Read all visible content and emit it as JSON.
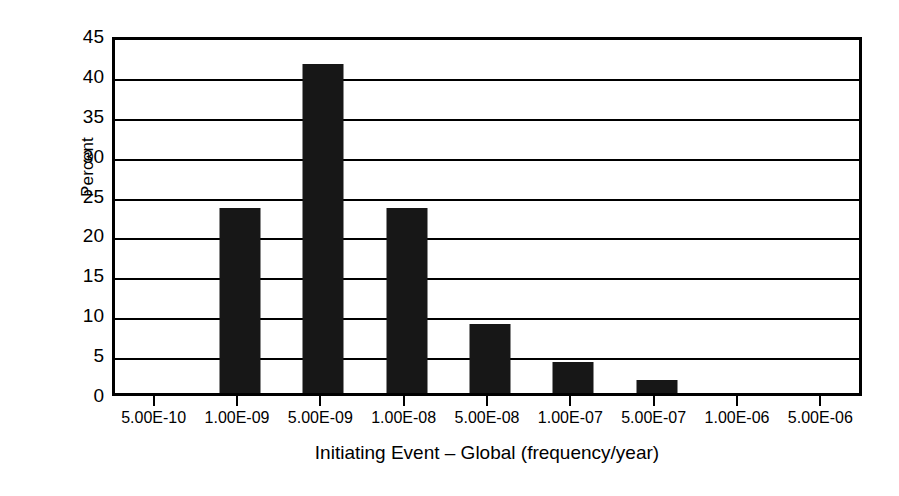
{
  "chart_data": {
    "type": "bar",
    "title": "",
    "xlabel": "Initiating Event – Global (frequency/year)",
    "ylabel": "Percent",
    "categories": [
      "5.00E-10",
      "1.00E-09",
      "5.00E-09",
      "1.00E-08",
      "5.00E-08",
      "1.00E-07",
      "5.00E-07",
      "1.00E-06",
      "5.00E-06"
    ],
    "values": [
      0,
      23.2,
      41.2,
      23.2,
      8.7,
      3.9,
      1.6,
      0,
      0
    ],
    "ylim": [
      0,
      45
    ],
    "ytick_labels": [
      "45",
      "40",
      "35",
      "30",
      "25",
      "20",
      "15",
      "10",
      "5",
      "0"
    ],
    "ytick_values": [
      45,
      40,
      35,
      30,
      25,
      20,
      15,
      10,
      5,
      0
    ],
    "ytick_step": 5,
    "grid": "horizontal",
    "legend": "none",
    "bar_color": "#171717",
    "axis_color": "#000000",
    "background_color": "#ffffff"
  }
}
